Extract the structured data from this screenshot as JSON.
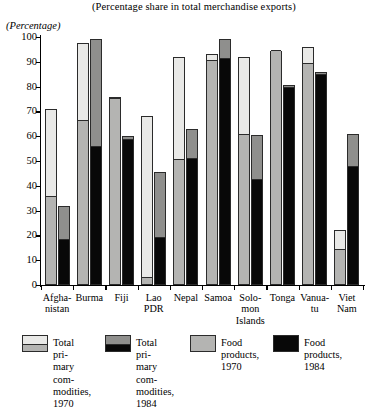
{
  "chart_data": {
    "type": "bar",
    "title": "(Percentage share in total merchandise exports)",
    "ylabel": "(Percentage)",
    "xlabel": "",
    "ylim": [
      0,
      100
    ],
    "ytick_labels": [
      "0",
      "10",
      "20",
      "30",
      "40",
      "50",
      "60",
      "70",
      "80",
      "90",
      "100"
    ],
    "ytick_values": [
      0,
      10,
      20,
      30,
      40,
      50,
      60,
      70,
      80,
      90,
      100
    ],
    "grid": false,
    "legend_position": "bottom",
    "categories": [
      "Afgha-\nnistan",
      "Burma",
      "Fiji",
      "Lao\nPDR",
      "Nepal",
      "Samoa",
      "Solo-\nmon\nIslands",
      "Tonga",
      "Vanua-\ntu",
      "Viet\nNam"
    ],
    "series": [
      {
        "name": "Total primary commodities, 1970",
        "color": "#e9e9e7",
        "values": [
          71,
          97.5,
          76,
          68,
          92,
          93,
          92,
          94.5,
          96,
          22
        ]
      },
      {
        "name": "Food products, 1970",
        "color": "#b4b4b2",
        "values": [
          35.5,
          66,
          75,
          3,
          50.5,
          90.5,
          60.5,
          94.5,
          89,
          14
        ]
      },
      {
        "name": "Total primary commodities, 1984",
        "color": "#8f8f8d",
        "values": [
          32,
          99,
          60,
          45.5,
          63,
          99,
          60.5,
          80.5,
          86,
          61
        ]
      },
      {
        "name": "Food products, 1984",
        "color": "#080808",
        "values": [
          18,
          55.5,
          58.5,
          19,
          51,
          91,
          42.5,
          79.5,
          84.5,
          47.5
        ]
      }
    ]
  },
  "legend": [
    {
      "key": "total-primary-1970",
      "swatch": "s1970",
      "label": "Total pri-\nmary com-\nmodities,\n1970"
    },
    {
      "key": "total-primary-1984",
      "swatch": "s1984",
      "label": "Total pri-\nmary com-\nmodities,\n1984"
    },
    {
      "key": "food-products-1970",
      "swatch": "solid-gray",
      "label": "Food\nproducts,\n1970"
    },
    {
      "key": "food-products-1984",
      "swatch": "solid-black",
      "label": "Food\nproducts,\n1984"
    }
  ]
}
